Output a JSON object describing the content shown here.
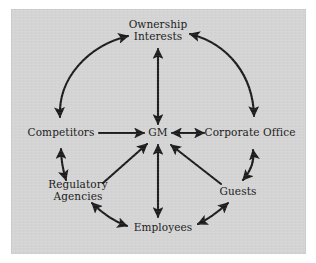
{
  "figure": {
    "background_color": "#ffffff",
    "panel_color": "#d4d4d4",
    "ink_color": "#1c1c1c",
    "type": "hub-and-spoke stakeholder relationship diagram"
  },
  "nodes": [
    {
      "id": "ownership",
      "label_lines": [
        "Ownership",
        "Interests"
      ],
      "x": 158,
      "y": 30
    },
    {
      "id": "competitors",
      "label_lines": [
        "Competitors"
      ],
      "x": 61,
      "y": 133
    },
    {
      "id": "gm",
      "label_lines": [
        "GM"
      ],
      "x": 158,
      "y": 133
    },
    {
      "id": "corporate-office",
      "label_lines": [
        "Corporate Office"
      ],
      "x": 250,
      "y": 133
    },
    {
      "id": "regulatory",
      "label_lines": [
        "Regulatory",
        "Agencies"
      ],
      "x": 78,
      "y": 190
    },
    {
      "id": "guests",
      "label_lines": [
        "Guests"
      ],
      "x": 238,
      "y": 192
    },
    {
      "id": "employees",
      "label_lines": [
        "Employees"
      ],
      "x": 163,
      "y": 228
    }
  ],
  "edges": [
    {
      "id": "competitors-ownership",
      "from": "competitors",
      "to": "ownership",
      "style": "arc",
      "heads": "double"
    },
    {
      "id": "ownership-corporate-office",
      "from": "ownership",
      "to": "corporate-office",
      "style": "arc",
      "heads": "double"
    },
    {
      "id": "corporate-office-guests",
      "from": "corporate-office",
      "to": "guests",
      "style": "arc",
      "heads": "double"
    },
    {
      "id": "guests-employees",
      "from": "guests",
      "to": "employees",
      "style": "arc",
      "heads": "double"
    },
    {
      "id": "employees-regulatory",
      "from": "employees",
      "to": "regulatory",
      "style": "arc",
      "heads": "double"
    },
    {
      "id": "regulatory-competitors",
      "from": "regulatory",
      "to": "competitors",
      "style": "straight",
      "heads": "double"
    },
    {
      "id": "gm-ownership",
      "from": "gm",
      "to": "ownership",
      "style": "straight",
      "heads": "double"
    },
    {
      "id": "competitors-gm",
      "from": "competitors",
      "to": "gm",
      "style": "straight",
      "heads": "single"
    },
    {
      "id": "gm-corporate-office",
      "from": "gm",
      "to": "corporate-office",
      "style": "straight",
      "heads": "double"
    },
    {
      "id": "regulatory-gm",
      "from": "regulatory",
      "to": "gm",
      "style": "straight",
      "heads": "single"
    },
    {
      "id": "employees-gm",
      "from": "employees",
      "to": "gm",
      "style": "straight",
      "heads": "double"
    },
    {
      "id": "guests-gm",
      "from": "guests",
      "to": "gm",
      "style": "straight",
      "heads": "single"
    }
  ]
}
